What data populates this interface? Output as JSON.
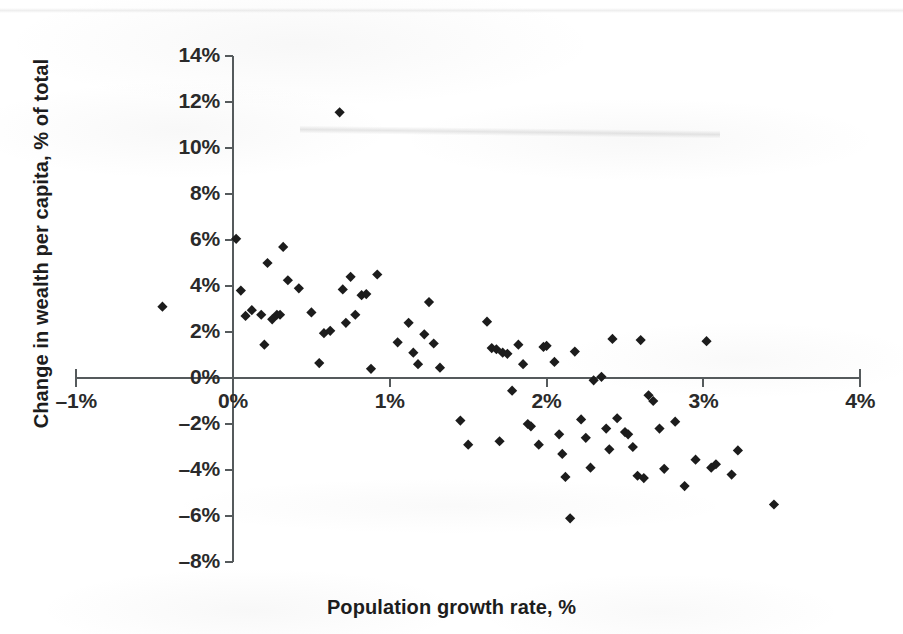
{
  "chart_data": {
    "type": "scatter",
    "title": "",
    "xlabel": "Population growth rate, %",
    "ylabel": "Change in wealth per capita, % of total",
    "xlim": [
      -1,
      4
    ],
    "ylim": [
      -8,
      14
    ],
    "xticks": [
      "-1%",
      "0%",
      "1%",
      "2%",
      "3%",
      "4%"
    ],
    "xtick_values": [
      -1,
      0,
      1,
      2,
      3,
      4
    ],
    "yticks": [
      "14%",
      "12%",
      "10%",
      "8%",
      "6%",
      "4%",
      "2%",
      "0%",
      "-2%",
      "-4%",
      "-6%",
      "-8%"
    ],
    "ytick_values": [
      14,
      12,
      10,
      8,
      6,
      4,
      2,
      0,
      -2,
      -4,
      -6,
      -8
    ],
    "grid": false,
    "legend": false,
    "marker": "diamond",
    "marker_color": "#1c1c1c",
    "marker_size": 9,
    "axis_color": "#555a5c",
    "background": "#ffffff",
    "series": [
      {
        "name": "Countries",
        "points": [
          [
            -0.45,
            3.1
          ],
          [
            0.02,
            6.05
          ],
          [
            0.05,
            3.8
          ],
          [
            0.08,
            2.7
          ],
          [
            0.12,
            2.95
          ],
          [
            0.18,
            2.75
          ],
          [
            0.2,
            1.45
          ],
          [
            0.22,
            5.0
          ],
          [
            0.25,
            2.55
          ],
          [
            0.28,
            2.75
          ],
          [
            0.3,
            2.75
          ],
          [
            0.32,
            5.7
          ],
          [
            0.35,
            4.25
          ],
          [
            0.42,
            3.9
          ],
          [
            0.5,
            2.85
          ],
          [
            0.55,
            0.65
          ],
          [
            0.58,
            1.95
          ],
          [
            0.62,
            2.05
          ],
          [
            0.68,
            11.55
          ],
          [
            0.7,
            3.85
          ],
          [
            0.72,
            2.4
          ],
          [
            0.75,
            4.4
          ],
          [
            0.78,
            2.75
          ],
          [
            0.82,
            3.6
          ],
          [
            0.85,
            3.65
          ],
          [
            0.88,
            0.4
          ],
          [
            0.92,
            4.5
          ],
          [
            1.05,
            1.55
          ],
          [
            1.12,
            2.4
          ],
          [
            1.15,
            1.1
          ],
          [
            1.18,
            0.6
          ],
          [
            1.22,
            1.9
          ],
          [
            1.25,
            3.3
          ],
          [
            1.28,
            1.5
          ],
          [
            1.32,
            0.45
          ],
          [
            1.45,
            -1.85
          ],
          [
            1.5,
            -2.9
          ],
          [
            1.62,
            2.45
          ],
          [
            1.65,
            1.3
          ],
          [
            1.68,
            1.25
          ],
          [
            1.7,
            -2.75
          ],
          [
            1.72,
            1.1
          ],
          [
            1.75,
            1.05
          ],
          [
            1.78,
            -0.55
          ],
          [
            1.82,
            1.45
          ],
          [
            1.85,
            0.6
          ],
          [
            1.88,
            -2.0
          ],
          [
            1.9,
            -2.1
          ],
          [
            1.95,
            -2.9
          ],
          [
            1.98,
            1.35
          ],
          [
            2.0,
            1.4
          ],
          [
            2.05,
            0.7
          ],
          [
            2.08,
            -2.45
          ],
          [
            2.1,
            -3.3
          ],
          [
            2.12,
            -4.3
          ],
          [
            2.15,
            -6.1
          ],
          [
            2.18,
            1.15
          ],
          [
            2.22,
            -1.8
          ],
          [
            2.25,
            -2.6
          ],
          [
            2.28,
            -3.9
          ],
          [
            2.3,
            -0.1
          ],
          [
            2.35,
            0.05
          ],
          [
            2.38,
            -2.2
          ],
          [
            2.4,
            -3.1
          ],
          [
            2.42,
            1.7
          ],
          [
            2.45,
            -1.75
          ],
          [
            2.5,
            -2.35
          ],
          [
            2.52,
            -2.45
          ],
          [
            2.55,
            -3.0
          ],
          [
            2.58,
            -4.25
          ],
          [
            2.6,
            1.65
          ],
          [
            2.62,
            -4.35
          ],
          [
            2.65,
            -0.75
          ],
          [
            2.68,
            -1.0
          ],
          [
            2.72,
            -2.2
          ],
          [
            2.75,
            -3.95
          ],
          [
            2.82,
            -1.9
          ],
          [
            2.88,
            -4.7
          ],
          [
            2.95,
            -3.55
          ],
          [
            3.02,
            1.6
          ],
          [
            3.05,
            -3.9
          ],
          [
            3.08,
            -3.75
          ],
          [
            3.18,
            -4.2
          ],
          [
            3.22,
            -3.15
          ],
          [
            3.45,
            -5.5
          ]
        ]
      }
    ]
  },
  "annotations": {
    "x_axis_title": "Population growth rate, %",
    "y_axis_title": "Change in wealth per capita, % of total"
  }
}
